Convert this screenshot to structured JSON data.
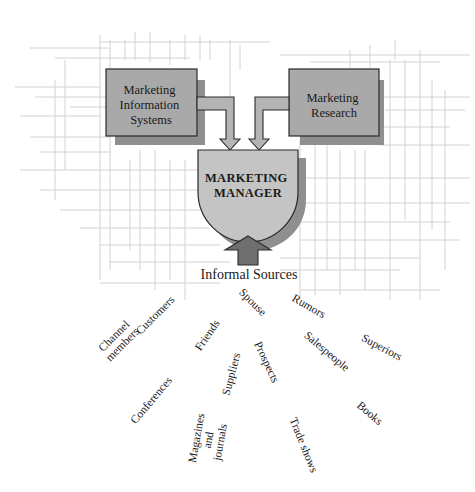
{
  "diagram": {
    "nodes": {
      "mis": {
        "lines": [
          "Marketing",
          "Information",
          "Systems"
        ]
      },
      "research": {
        "lines": [
          "Marketing",
          "Research"
        ]
      },
      "manager": {
        "lines": [
          "MARKETING",
          "MANAGER"
        ]
      }
    },
    "informal_sources": {
      "title": "Informal Sources",
      "items": [
        {
          "id": "channel-members",
          "lines": [
            "Channel",
            "members"
          ],
          "x": 118,
          "y": 340,
          "rotate": -45
        },
        {
          "id": "customers",
          "lines": [
            "Customers"
          ],
          "x": 155,
          "y": 315,
          "rotate": -45
        },
        {
          "id": "friends",
          "lines": [
            "Friends"
          ],
          "x": 207,
          "y": 335,
          "rotate": -55
        },
        {
          "id": "conferences",
          "lines": [
            "Conferences"
          ],
          "x": 151,
          "y": 400,
          "rotate": -50
        },
        {
          "id": "suppliers",
          "lines": [
            "Suppliers"
          ],
          "x": 231,
          "y": 374,
          "rotate": -75
        },
        {
          "id": "magazines-and-journals",
          "lines": [
            "Magazines",
            "and",
            "journals"
          ],
          "x": 208,
          "y": 440,
          "rotate": -80
        },
        {
          "id": "spouse",
          "lines": [
            "Spouse"
          ],
          "x": 253,
          "y": 302,
          "rotate": 45
        },
        {
          "id": "prospects",
          "lines": [
            "Prospects"
          ],
          "x": 267,
          "y": 362,
          "rotate": 65
        },
        {
          "id": "trade-shows",
          "lines": [
            "Trade shows"
          ],
          "x": 304,
          "y": 445,
          "rotate": 68
        },
        {
          "id": "rumors",
          "lines": [
            "Rumors"
          ],
          "x": 309,
          "y": 306,
          "rotate": 30
        },
        {
          "id": "salespeople",
          "lines": [
            "Salespeople"
          ],
          "x": 327,
          "y": 351,
          "rotate": 40
        },
        {
          "id": "superiors",
          "lines": [
            "Superiors"
          ],
          "x": 382,
          "y": 347,
          "rotate": 28
        },
        {
          "id": "books",
          "lines": [
            "Books"
          ],
          "x": 370,
          "y": 413,
          "rotate": 40
        }
      ]
    },
    "colors": {
      "box_fill": "#a9a9a9",
      "manager_fill": "#c4c4c4",
      "arrow_fill": "#b4b4b4",
      "up_arrow_fill": "#6f6f6f",
      "grid": "#d2d2d2"
    }
  }
}
